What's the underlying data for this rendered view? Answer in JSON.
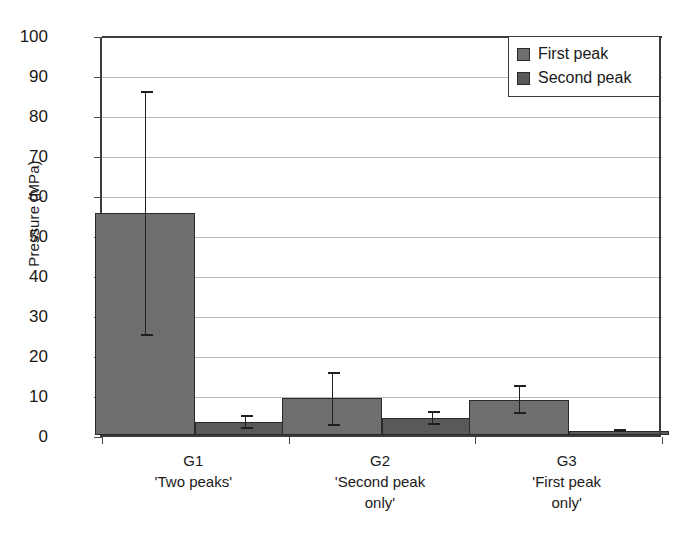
{
  "chart_data": {
    "type": "bar",
    "title": "",
    "subtitle": "",
    "xlabel": "",
    "ylabel": "Pressure (MPa)",
    "ylim": [
      0,
      100
    ],
    "ytick_step": 10,
    "ytick_labels": [
      "100",
      "90",
      "80",
      "70",
      "60",
      "50",
      "40",
      "30",
      "20",
      "10",
      "0"
    ],
    "ytick_values": [
      100,
      90,
      80,
      70,
      60,
      50,
      40,
      30,
      20,
      10,
      0
    ],
    "grid": true,
    "grid_axis": "y",
    "legend_position": "top-right",
    "categories": [
      "G1",
      "G2",
      "G3"
    ],
    "category_sublabels": [
      "'Two peaks'",
      "'Second peak only'",
      "'First peak only'"
    ],
    "category_sublabel_lines": [
      [
        "'Two peaks'"
      ],
      [
        "'Second peak",
        "only'"
      ],
      [
        "'First peak",
        "only'"
      ]
    ],
    "series": [
      {
        "name": "First peak",
        "color": "#6e6e6e",
        "values": [
          55.5,
          9.2,
          8.8
        ],
        "error_upper": [
          86.0,
          15.8,
          12.5
        ],
        "error_lower": [
          24.7,
          2.2,
          5.2
        ]
      },
      {
        "name": "Second peak",
        "color": "#595959",
        "values": [
          3.3,
          4.2,
          1.0
        ],
        "error_upper": [
          5.0,
          6.0,
          1.4
        ],
        "error_lower": [
          1.6,
          2.6,
          0.7
        ]
      }
    ],
    "axis_color": "#3b3b3b",
    "gridline_color": "#b9b9b9",
    "bar_border_color": "#2a2a2a",
    "errorbar_color": "#1f1f1f",
    "background_color": "#ffffff"
  },
  "legend": {
    "entries": [
      {
        "label": "First peak",
        "color": "#6e6e6e"
      },
      {
        "label": "Second peak",
        "color": "#595959"
      }
    ]
  }
}
